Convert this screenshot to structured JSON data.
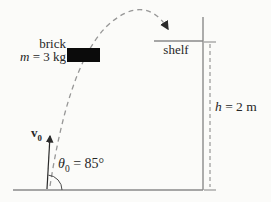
{
  "diagram": {
    "kind": "projectile-motion-physics-figure",
    "brick": {
      "label": "brick",
      "mass_symbol": "m",
      "mass_rest": " = 3 kg"
    },
    "shelf": {
      "label": "shelf"
    },
    "height": {
      "symbol": "h",
      "rest": " = 2 m"
    },
    "launch": {
      "velocity_symbol": "v",
      "velocity_sub": "0",
      "angle_symbol": "θ",
      "angle_sub": "0",
      "angle_rest": " = 85°"
    },
    "colors": {
      "structure_line": "#8a8a8a",
      "trajectory_dash": "#979797",
      "dimension_line": "#8f8f8f",
      "ink": "#2a2a2a",
      "brick_fill": "#0b0b0b",
      "arc": "#4a4a4a"
    }
  }
}
